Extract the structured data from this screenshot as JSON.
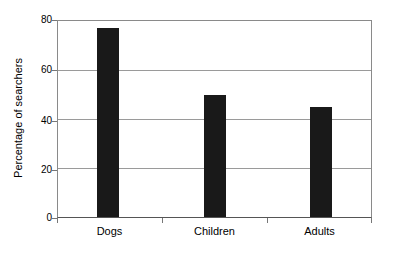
{
  "chart_data": {
    "type": "bar",
    "title": "",
    "subtitle": "",
    "xlabel": "",
    "ylabel": "Percentage of searchers",
    "categories": [
      "Dogs",
      "Children",
      "Adults"
    ],
    "values": [
      77,
      50,
      45
    ],
    "series": [
      {
        "name": "Percentage of searchers",
        "values": [
          77,
          50,
          45
        ]
      }
    ],
    "ylim": [
      0,
      80
    ],
    "xlim": [
      0,
      3
    ],
    "y_ticks": [
      0,
      20,
      40,
      60,
      80
    ],
    "y_tick_labels": [
      "0",
      "20",
      "40",
      "60",
      "80"
    ],
    "grid": true,
    "grid_axis": "y",
    "legend": false,
    "legend_position": "none",
    "bar_color": "#191919",
    "background_color": "#ffffff",
    "gridline_color": "#9a9a9a",
    "axis_color": "#555555",
    "annotations": []
  },
  "axes": {
    "y_title": "Percentage of searchers",
    "ticks": [
      {
        "label": "80",
        "value": 80
      },
      {
        "label": "60",
        "value": 60
      },
      {
        "label": "40",
        "value": 40
      },
      {
        "label": "20",
        "value": 20
      },
      {
        "label": "0",
        "value": 0
      }
    ]
  },
  "bars": [
    {
      "label": "Dogs",
      "value": 77
    },
    {
      "label": "Children",
      "value": 50
    },
    {
      "label": "Adults",
      "value": 45
    }
  ]
}
